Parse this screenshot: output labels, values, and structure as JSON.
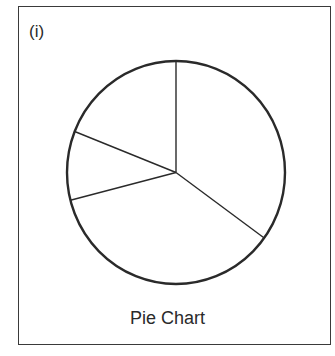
{
  "panel": {
    "label": "(i)",
    "caption": "Pie Chart"
  },
  "colors": {
    "stroke": "#2a2a2a",
    "fill": "#ffffff"
  },
  "chart_data": {
    "type": "pie",
    "title": "Pie Chart",
    "panel_label": "(i)",
    "categories": [
      "Slice A",
      "Slice B",
      "Slice C",
      "Slice D"
    ],
    "values": [
      35,
      36,
      10,
      19
    ],
    "start_angle_deg": 0,
    "direction": "clockwise",
    "legend": "none",
    "data_labels": "none",
    "fill": "unfilled (outline only)"
  }
}
